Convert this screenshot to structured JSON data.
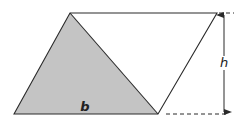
{
  "diagram": {
    "labels": {
      "base": "b",
      "height": "h"
    },
    "colors": {
      "stroke": "#2a2a2a",
      "shade": "#c4c4c4",
      "background": "#ffffff"
    },
    "shapes": {
      "parallelogram": [
        [
          14,
          114
        ],
        [
          70,
          13
        ],
        [
          217,
          13
        ],
        [
          158,
          114
        ]
      ],
      "shaded_triangle": [
        [
          14,
          114
        ],
        [
          70,
          13
        ],
        [
          158,
          114
        ]
      ]
    }
  }
}
